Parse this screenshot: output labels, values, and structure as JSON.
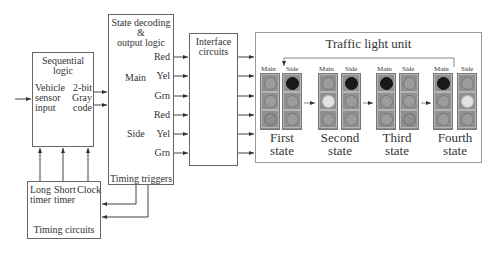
{
  "sequential_logic": {
    "title_line1": "Sequential",
    "title_line2": "logic",
    "input_lines": [
      "Vehicle",
      "sensor",
      "input"
    ],
    "output_lines": [
      "2-bit",
      "Gray",
      "code"
    ]
  },
  "state_decoding": {
    "title_line1": "State decoding",
    "title_line2": "&",
    "title_line3": "output logic",
    "groups": [
      {
        "label": "Main",
        "signals": [
          "Red",
          "Yel",
          "Grn"
        ]
      },
      {
        "label": "Side",
        "signals": [
          "Red",
          "Yel",
          "Grn"
        ]
      }
    ],
    "footer": "Timing triggers"
  },
  "interface_circuits": {
    "title_line1": "Interface",
    "title_line2": "circuits"
  },
  "traffic_light_unit": {
    "title": "Traffic light unit",
    "main_label": "Main",
    "side_label": "Side",
    "states": [
      {
        "name_line1": "First",
        "name_line2": "state",
        "main": [
          "off",
          "off",
          "green_on"
        ],
        "side": [
          "red_on",
          "off",
          "off"
        ]
      },
      {
        "name_line1": "Second",
        "name_line2": "state",
        "main": [
          "off",
          "yellow_on",
          "off"
        ],
        "side": [
          "red_on",
          "off",
          "off"
        ]
      },
      {
        "name_line1": "Third",
        "name_line2": "state",
        "main": [
          "red_on",
          "off",
          "off"
        ],
        "side": [
          "off",
          "off",
          "green_on"
        ]
      },
      {
        "name_line1": "Fourth",
        "name_line2": "state",
        "main": [
          "red_on",
          "off",
          "off"
        ],
        "side": [
          "off",
          "yellow_on",
          "off"
        ]
      }
    ]
  },
  "timing_circuits": {
    "title": "Timing circuits",
    "inputs": [
      {
        "line1": "Long",
        "line2": "timer"
      },
      {
        "line1": "Short",
        "line2": "timer"
      },
      {
        "line1": "Clock",
        "line2": ""
      }
    ]
  }
}
